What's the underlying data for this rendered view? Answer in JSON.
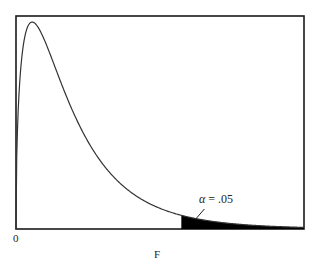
{
  "chart_data": {
    "type": "area",
    "title": "",
    "distribution": "F",
    "df1": 3,
    "df2": 20,
    "xlabel": "F",
    "ylabel": "",
    "x_tick_labels": [
      "0"
    ],
    "xlim": [
      0,
      5.4
    ],
    "critical_value": 3.1,
    "shaded_region": "upper tail",
    "annotation": {
      "symbol": "α",
      "text": " = .05",
      "value": 0.05
    },
    "grid": false,
    "legend": "none",
    "colors": {
      "curve": "#333333",
      "tail_fill": "#000000",
      "frame": "#1a1a1a"
    }
  }
}
